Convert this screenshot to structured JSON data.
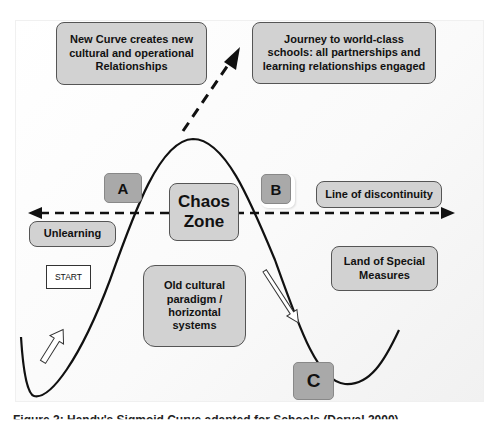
{
  "diagram": {
    "boxes": {
      "new_curve": "New Curve creates new cultural and operational Relationships",
      "journey": "Journey to world-class schools: all partnerships and learning relationships engaged",
      "chaos_zone_line1": "Chaos",
      "chaos_zone_line2": "Zone",
      "line_of_discontinuity": "Line of discontinuity",
      "unlearning": "Unlearning",
      "land_of_special_measures": "Land of Special Measures",
      "old_paradigm": "Old cultural paradigm / horizontal systems",
      "start": "START"
    },
    "markers": {
      "a": "A",
      "b": "B",
      "c": "C"
    },
    "colors": {
      "box_fill": "#d2d2d2",
      "marker_fill": "#a9a9a9",
      "line": "#111111",
      "panel_bg": "#f6f6f6"
    },
    "caption_partial": "Figure 2: Handy's Sigmoid Curve adapted for Schools (Dorval 2000)"
  }
}
